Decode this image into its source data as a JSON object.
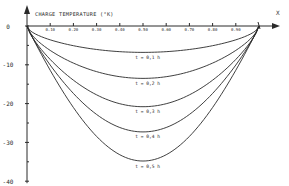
{
  "chart_data": {
    "type": "line",
    "title": "CHARGE TEMPERATURE (°K)",
    "xlabel": "X",
    "ylabel": "CHARGE TEMPERATURE (°K)",
    "x_tick_labels": [
      "0.10",
      "0.20",
      "0.30",
      "0.40",
      "0.50",
      "0.60",
      "0.70",
      "0.80",
      "0.90"
    ],
    "x_ticks": [
      0.1,
      0.2,
      0.3,
      0.4,
      0.5,
      0.6,
      0.7,
      0.8,
      0.9
    ],
    "y_tick_labels": [
      "0",
      "-10",
      "-20",
      "-30",
      "-40"
    ],
    "y_ticks": [
      0,
      -10,
      -20,
      -30,
      -40
    ],
    "xlim": [
      0,
      1.0
    ],
    "ylim": [
      -40,
      0
    ],
    "grid": false,
    "legend": "inline labels under each curve",
    "series": [
      {
        "name": "t = 0,1 h",
        "min_value": -6.8
      },
      {
        "name": "t = 0,2 h",
        "min_value": -13.5
      },
      {
        "name": "t = 0,3 h",
        "min_value": -20.8
      },
      {
        "name": "t = 0,4 h",
        "min_value": -27.3
      },
      {
        "name": "t = 0,5 h",
        "min_value": -34.8
      }
    ],
    "x": [
      0,
      0.05,
      0.1,
      0.2,
      0.3,
      0.4,
      0.5,
      0.6,
      0.7,
      0.8,
      0.9,
      0.95,
      1.0
    ],
    "curve_shape": "symmetric-ish U profiles, zero at x=0 and x=1, minimum near x=0.5"
  },
  "labels": {
    "title": "CHARGE TEMPERATURE (°K)",
    "x_axis": "X",
    "curves": [
      "t = 0,1 h",
      "t = 0,2 h",
      "t = 0,3 h",
      "t = 0,4 h",
      "t = 0,5 h"
    ],
    "y_ticks": [
      "0",
      "-10",
      "-20",
      "-30",
      "-40"
    ],
    "x_ticks": [
      "0.10",
      "0.20",
      "0.30",
      "0.40",
      "0.50",
      "0.60",
      "0.70",
      "0.80",
      "0.90"
    ]
  },
  "colors": {
    "ink": "#2a2a2a",
    "background": "#ffffff"
  }
}
